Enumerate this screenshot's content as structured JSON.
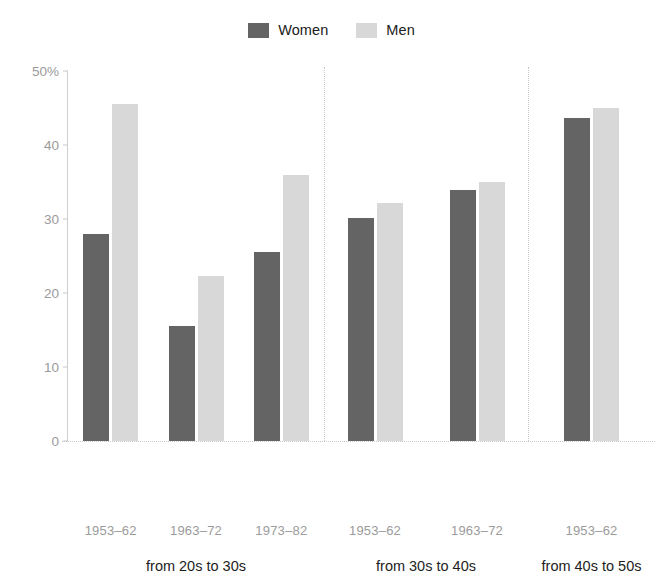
{
  "chart_data": {
    "type": "bar",
    "title": "",
    "xlabel": "",
    "ylabel": "",
    "ylim": [
      0,
      50
    ],
    "ytick_labels": [
      "0",
      "10",
      "20",
      "30",
      "40",
      "50%"
    ],
    "ytick_values": [
      0,
      10,
      20,
      30,
      40,
      50
    ],
    "grid": false,
    "legend_position": "top-center",
    "series": [
      {
        "name": "Women",
        "color": "#646464"
      },
      {
        "name": "Men",
        "color": "#d8d8d8"
      }
    ],
    "groups": [
      {
        "label": "from 20s to 30s",
        "categories": [
          "1953–62",
          "1963–72",
          "1973–82"
        ],
        "values": {
          "Women": [
            28.0,
            15.5,
            25.5
          ],
          "Men": [
            45.5,
            22.3,
            36.0
          ]
        }
      },
      {
        "label": "from 30s to 40s",
        "categories": [
          "1953–62",
          "1963–72"
        ],
        "values": {
          "Women": [
            30.2,
            33.9
          ],
          "Men": [
            32.1,
            35.0
          ]
        }
      },
      {
        "label": "from 40s to 50s",
        "categories": [
          "1953–62"
        ],
        "values": {
          "Women": [
            43.6
          ],
          "Men": [
            45.0
          ]
        }
      }
    ]
  },
  "legend": {
    "entries": [
      {
        "label": "Women",
        "color": "#646464",
        "swatch_name": "legend-swatch-women"
      },
      {
        "label": "Men",
        "color": "#d8d8d8",
        "swatch_name": "legend-swatch-men"
      }
    ]
  },
  "colors": {
    "women": "#646464",
    "men": "#d8d8d8",
    "axis": "#c9c9c9",
    "tick_text": "#9a9a9a",
    "group_text": "#1d1d1d",
    "background": "#ffffff"
  }
}
